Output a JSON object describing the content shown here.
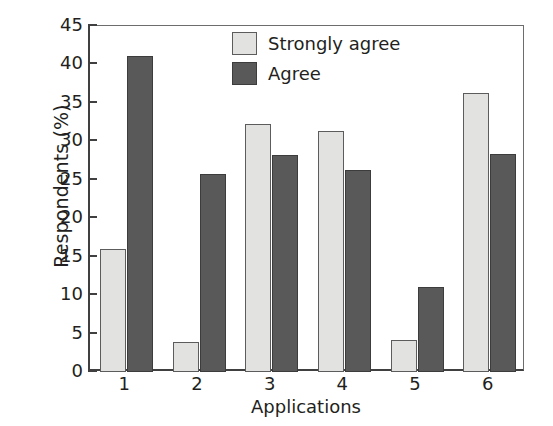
{
  "chart_data": {
    "type": "bar",
    "title": "",
    "xlabel": "Applications",
    "ylabel": "Respondents (%)",
    "categories": [
      "1",
      "2",
      "3",
      "4",
      "5",
      "6"
    ],
    "series": [
      {
        "name": "Strongly agree",
        "color": "#e2e2e0",
        "values": [
          16.0,
          3.9,
          32.2,
          31.3,
          4.1,
          36.3
        ]
      },
      {
        "name": "Agree",
        "color": "#59595a",
        "values": [
          41.1,
          25.7,
          28.2,
          26.3,
          11.1,
          28.4
        ]
      }
    ],
    "ylim": [
      0,
      45
    ],
    "yticks": [
      0,
      5,
      10,
      15,
      20,
      25,
      30,
      35,
      40,
      45
    ],
    "ytick_labels": [
      "0",
      "5",
      "10",
      "15",
      "20",
      "25",
      "30",
      "35",
      "40",
      "45"
    ],
    "grid": false,
    "legend_position": "top-center"
  },
  "legend": {
    "items": [
      {
        "label": "Strongly agree",
        "swatch": "light"
      },
      {
        "label": "Agree",
        "swatch": "dark"
      }
    ]
  }
}
